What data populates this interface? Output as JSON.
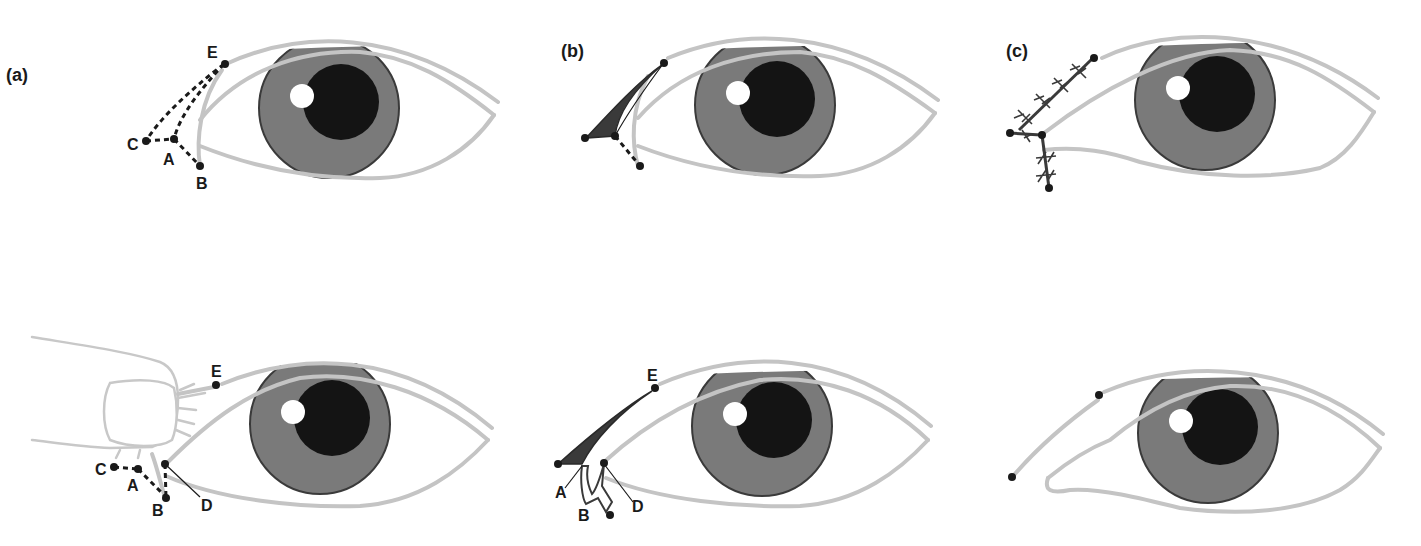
{
  "figure": {
    "panel_labels": [
      "(a)",
      "(b)",
      "(c)"
    ],
    "top_row": {
      "a": {
        "points": [
          "E",
          "C",
          "A",
          "B"
        ]
      },
      "b": {
        "points": []
      },
      "c": {
        "points": []
      }
    },
    "bottom_row": {
      "a": {
        "points": [
          "E",
          "C",
          "A",
          "B",
          "D"
        ]
      },
      "b": {
        "points": [
          "E",
          "A",
          "B",
          "D"
        ]
      },
      "c": {
        "points": []
      }
    },
    "colors": {
      "lid_outline": "#c4c4c4",
      "iris": "#7a7a7a",
      "pupil": "#141414",
      "glint": "#ffffff",
      "markers": "#1a1a1a"
    }
  }
}
